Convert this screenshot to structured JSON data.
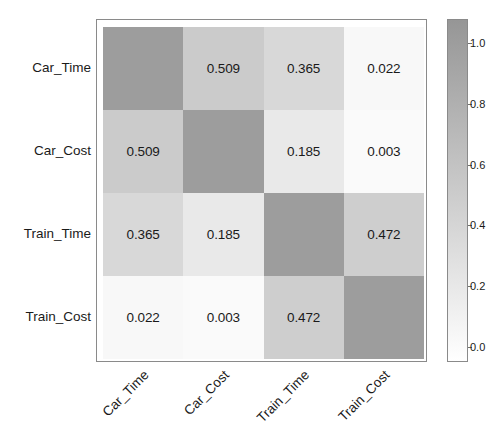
{
  "chart_data": {
    "type": "heatmap",
    "title": "",
    "xlabel": "",
    "ylabel": "",
    "categories": [
      "Car_Time",
      "Car_Cost",
      "Train_Time",
      "Train_Cost"
    ],
    "x_tick_labels": [
      "Car_Time",
      "Car_Cost",
      "Train_Time",
      "Train_Cost"
    ],
    "y_tick_labels": [
      "Car_Time",
      "Car_Cost",
      "Train_Time",
      "Train_Cost"
    ],
    "x_tick_rotation": -45,
    "grid": false,
    "colormap": "greys",
    "color_low": "#ffffff",
    "color_high": "#969696",
    "annotation_format": "0.000",
    "matrix": [
      [
        1.0,
        0.509,
        0.365,
        0.022
      ],
      [
        0.509,
        1.0,
        0.185,
        0.003
      ],
      [
        0.365,
        0.185,
        1.0,
        0.472
      ],
      [
        0.022,
        0.003,
        0.472,
        1.0
      ]
    ],
    "annotations": [
      [
        "",
        "0.509",
        "0.365",
        "0.022"
      ],
      [
        "0.509",
        "",
        "0.185",
        "0.003"
      ],
      [
        "0.365",
        "0.185",
        "",
        "0.472"
      ],
      [
        "0.022",
        "0.003",
        "0.472",
        ""
      ]
    ],
    "colorbar": {
      "position": "right",
      "vmin": -0.05,
      "vmax": 1.08,
      "ticks": [
        1.0,
        0.8,
        0.6,
        0.4,
        0.2,
        0.0
      ],
      "tick_labels": [
        "1.0",
        "0.8",
        "0.6",
        "0.4",
        "0.2",
        "0.0"
      ]
    }
  }
}
